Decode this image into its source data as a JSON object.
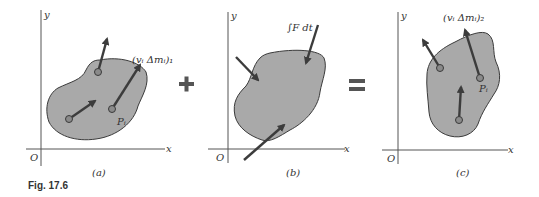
{
  "figure": {
    "caption": "Fig. 17.6",
    "operators": {
      "plus": "+",
      "equals": "="
    },
    "panels": [
      {
        "id": "a",
        "label": "(a)",
        "axis_labels": {
          "x": "x",
          "y": "y",
          "origin": "O"
        },
        "vector_label": "(vᵢ Δmᵢ)₁",
        "point_label": "Pᵢ"
      },
      {
        "id": "b",
        "label": "(b)",
        "axis_labels": {
          "x": "x",
          "y": "y",
          "origin": "O"
        },
        "impulse_label": "∫F dt"
      },
      {
        "id": "c",
        "label": "(c)",
        "axis_labels": {
          "x": "x",
          "y": "y",
          "origin": "O"
        },
        "vector_label": "(vᵢ Δmᵢ)₂",
        "point_label": "Pᵢ"
      }
    ],
    "colors": {
      "blob_fill": "#a9a9a9",
      "arrow": "#3c3c3c",
      "axis": "#555555"
    }
  }
}
